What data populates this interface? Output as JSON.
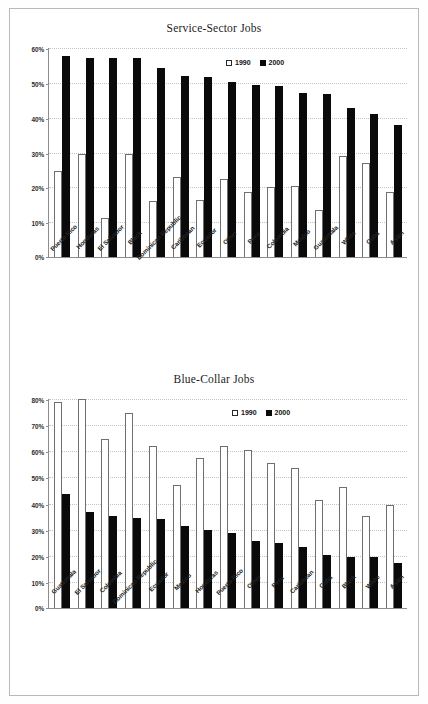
{
  "chart_data": [
    {
      "type": "bar",
      "title": "Service-Sector Jobs",
      "xlabel": "",
      "ylabel": "",
      "ylim": [
        0,
        60
      ],
      "ytick_labels": [
        "60%",
        "50%",
        "40%",
        "30%",
        "20%",
        "10%",
        "0%"
      ],
      "yticks": [
        60,
        50,
        40,
        30,
        20,
        10,
        0
      ],
      "grid": true,
      "legend_position": "top-center",
      "categories": [
        "Puerto Rico",
        "Honduras",
        "El Salvador",
        "Black",
        "Dominican Republic",
        "Caribbean",
        "Ecuador",
        "Other",
        "Peru",
        "Colombia",
        "Mexico",
        "Guatemala",
        "White",
        "Cuba",
        "Asian"
      ],
      "series": [
        {
          "name": "1990",
          "color": "#ffffff",
          "values": [
            24.6,
            29.5,
            11.1,
            29.7,
            16.2,
            22.9,
            16.3,
            22.3,
            18.8,
            20.1,
            20.3,
            13.6,
            29.0,
            27.1,
            18.6
          ]
        },
        {
          "name": "2000",
          "color": "#0a0a0a",
          "values": [
            57.6,
            57.2,
            57.1,
            57.0,
            54.2,
            52.1,
            51.8,
            50.3,
            49.3,
            49.1,
            47.1,
            46.9,
            42.9,
            41.2,
            37.9
          ]
        }
      ]
    },
    {
      "type": "bar",
      "title": "Blue-Collar Jobs",
      "xlabel": "",
      "ylabel": "",
      "ylim": [
        0,
        80
      ],
      "ytick_labels": [
        "80%",
        "70%",
        "60%",
        "50%",
        "40%",
        "30%",
        "20%",
        "10%",
        "0%"
      ],
      "yticks": [
        80,
        70,
        60,
        50,
        40,
        30,
        20,
        10,
        0
      ],
      "grid": true,
      "legend_position": "top-center",
      "categories": [
        "Guatemala",
        "El Salvador",
        "Colombia",
        "Dominican Republic",
        "Ecuador",
        "Mexico",
        "Honduras",
        "Puerto Rico",
        "Other",
        "Peru",
        "Caribbean",
        "Cuba",
        "Black",
        "White",
        "Asian"
      ],
      "series": [
        {
          "name": "1990",
          "color": "#ffffff",
          "values": [
            78.7,
            80.1,
            64.8,
            74.5,
            62.2,
            47.2,
            57.4,
            62.0,
            60.5,
            55.4,
            53.7,
            41.2,
            46.5,
            35.3,
            39.3
          ]
        },
        {
          "name": "2000",
          "color": "#0a0a0a",
          "values": [
            43.8,
            36.8,
            35.1,
            34.3,
            34.1,
            31.5,
            29.9,
            28.8,
            25.5,
            25.0,
            23.5,
            20.4,
            19.7,
            19.4,
            17.1
          ]
        }
      ]
    }
  ],
  "legend": {
    "items": [
      {
        "label": "1990",
        "swatch": "open-square-icon"
      },
      {
        "label": "2000",
        "swatch": "filled-square-icon"
      }
    ]
  }
}
